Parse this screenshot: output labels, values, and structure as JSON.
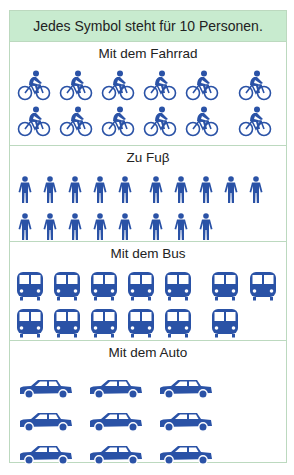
{
  "header": {
    "text": "Jedes Symbol steht für 10 Personen."
  },
  "colors": {
    "icon": "#2a52a6",
    "header_bg": "#c8ebcf",
    "border": "#bcd9bf"
  },
  "sections": [
    {
      "title": "Mit dem Fahrrad",
      "icon": "bicycle-icon",
      "count": 12
    },
    {
      "title": "Zu Fuβ",
      "icon": "person-walking-icon",
      "count": 18
    },
    {
      "title": "Mit dem Bus",
      "icon": "bus-icon",
      "count": 13
    },
    {
      "title": "Mit dem Auto",
      "icon": "car-icon",
      "count": 9
    }
  ],
  "chart_data": {
    "type": "pictogram",
    "title": "Jedes Symbol steht für 10 Personen.",
    "unit_per_symbol": 10,
    "categories": [
      "Mit dem Fahrrad",
      "Zu Fuβ",
      "Mit dem Bus",
      "Mit dem Auto"
    ],
    "symbol_counts": [
      12,
      18,
      13,
      9
    ],
    "values": [
      120,
      180,
      130,
      90
    ],
    "xlabel": "",
    "ylabel": "Personen"
  }
}
